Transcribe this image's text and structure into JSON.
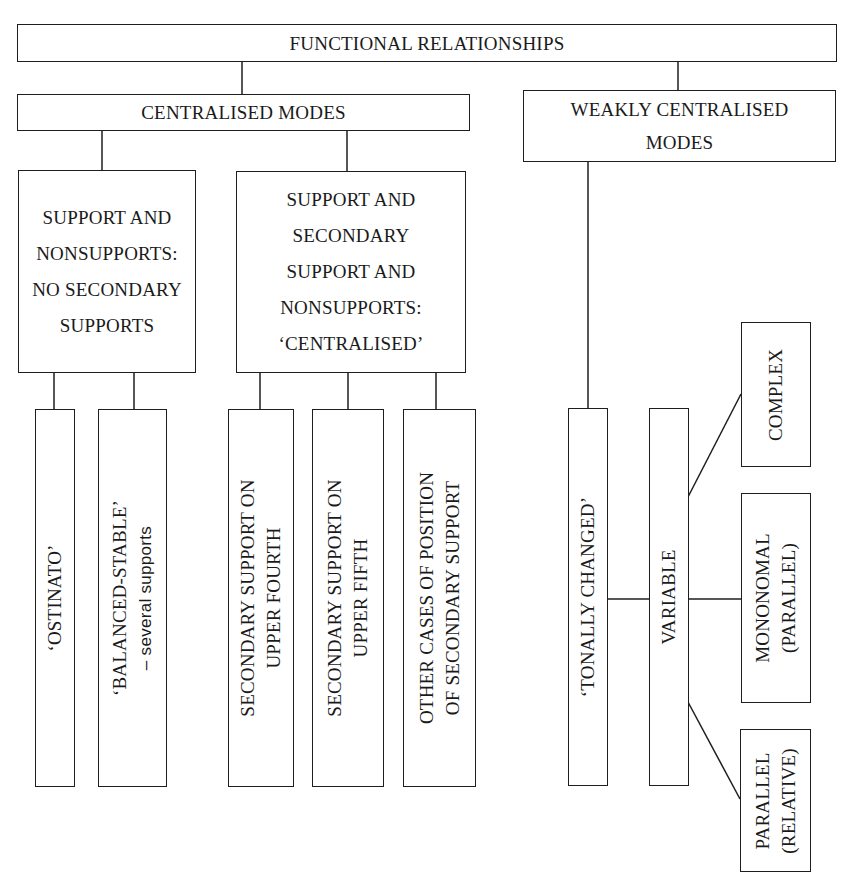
{
  "diagram": {
    "root": {
      "label": "FUNCTIONAL RELATIONSHIPS"
    },
    "level1": [
      {
        "id": "centralised",
        "label": "CENTRALISED MODES"
      },
      {
        "id": "weakly",
        "label": "WEAKLY CENTRALISED\nMODES"
      }
    ],
    "level2": [
      {
        "id": "no-secondary",
        "label": "SUPPORT AND\nNONSUPPORTS:\nNO SECONDARY\nSUPPORTS"
      },
      {
        "id": "with-secondary",
        "label": "SUPPORT AND\nSECONDARY\nSUPPORT AND\nNONSUPPORTS:\n‘CENTRALISED’"
      }
    ],
    "leaves": [
      {
        "id": "ostinato",
        "line1": "‘OSTINATO’",
        "line2": ""
      },
      {
        "id": "balanced-stable",
        "line1": "‘BALANCED-STABLE’",
        "line2": "– several supports"
      },
      {
        "id": "upper-fourth",
        "line1": "SECONDARY SUPPORT ON",
        "line2": "UPPER FOURTH"
      },
      {
        "id": "upper-fifth",
        "line1": "SECONDARY SUPPORT ON",
        "line2": "UPPER FIFTH"
      },
      {
        "id": "other-cases",
        "line1": "OTHER CASES OF POSITION",
        "line2": "OF SECONDARY SUPPORT"
      },
      {
        "id": "tonally-changed",
        "line1": "‘TONALLY CHANGED’",
        "line2": ""
      },
      {
        "id": "variable",
        "line1": "VARIABLE",
        "line2": ""
      }
    ],
    "variable_children": [
      {
        "id": "complex",
        "line1": "COMPLEX",
        "line2": ""
      },
      {
        "id": "mononomal",
        "line1": "MONONOMAL",
        "line2": "(PARALLEL)"
      },
      {
        "id": "parallel",
        "line1": "PARALLEL",
        "line2": "(RELATIVE)"
      }
    ],
    "colors": {
      "line": "#1e1e1e",
      "background": "#ffffff"
    }
  }
}
